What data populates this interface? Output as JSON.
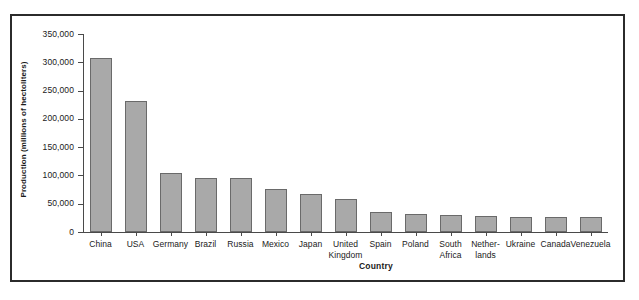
{
  "figure": {
    "frame_color": "#2b2b2b",
    "background": "#ffffff"
  },
  "chart_data": {
    "type": "bar",
    "title": "",
    "xlabel": "Country",
    "ylabel": "Production (millions of hectoliters)",
    "ylim": [
      0,
      350000
    ],
    "ytick_labels": [
      "350,000",
      "300,000",
      "250,000",
      "200,000",
      "150,000",
      "100,000",
      "50,000",
      "0"
    ],
    "ytick_values": [
      350000,
      300000,
      250000,
      200000,
      150000,
      100000,
      50000,
      0
    ],
    "grid": false,
    "legend": false,
    "bar_color": "#a9a9a9",
    "bar_edge_color": "#6a6a6a",
    "categories": [
      "China",
      "USA",
      "Germany",
      "Brazil",
      "Russia",
      "Mexico",
      "Japan",
      "United Kingdom",
      "Spain",
      "Poland",
      "South Africa",
      "Nether-lands",
      "Ukraine",
      "Canada",
      "Venezuela"
    ],
    "category_lines": [
      [
        "China"
      ],
      [
        "USA"
      ],
      [
        "Germany"
      ],
      [
        "Brazil"
      ],
      [
        "Russia"
      ],
      [
        "Mexico"
      ],
      [
        "Japan"
      ],
      [
        "United",
        "Kingdom"
      ],
      [
        "Spain"
      ],
      [
        "Poland"
      ],
      [
        "South",
        "Africa"
      ],
      [
        "Nether-",
        "lands"
      ],
      [
        "Ukraine"
      ],
      [
        "Canada"
      ],
      [
        "Venezuela"
      ]
    ],
    "values": [
      307500,
      231500,
      104000,
      95000,
      95000,
      76000,
      67000,
      58500,
      35500,
      32000,
      30000,
      27500,
      27000,
      27000,
      27000
    ]
  }
}
